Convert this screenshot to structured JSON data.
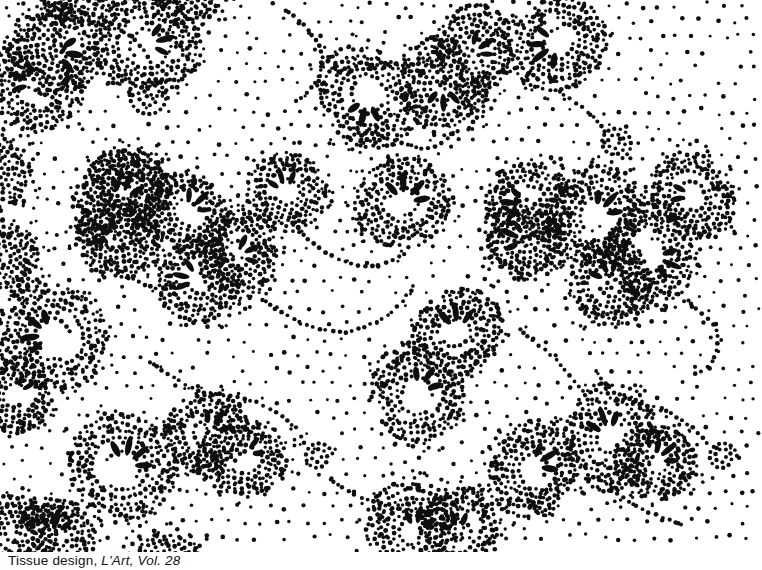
{
  "figure": {
    "caption_roman": "Tissue design, ",
    "caption_italic": "L'Art, Vol. 28",
    "ink_color": "#0e0e0e",
    "background_color": "#ffffff",
    "width": 762,
    "height": 570,
    "pattern_height": 552
  },
  "pattern": {
    "seed": 11,
    "background_dots": {
      "spacing": 16,
      "jitter": 7,
      "radius": 1.9,
      "radius_jitter": 0.5,
      "clear_radius": 27
    },
    "cloud": {
      "dot_radius": 2.05,
      "dot_radius_jitter": 0.45,
      "ring_radii": [
        15,
        21,
        27,
        33,
        39,
        46
      ],
      "cloudlet_ring_radii": [
        8,
        14,
        20,
        26,
        32,
        38
      ],
      "ring_spacing": 6.3,
      "scatter_count": 70,
      "fringe_count": 13
    },
    "petal": {
      "length": 19,
      "width": 6.4,
      "offset": 10,
      "spread_deg": 40
    },
    "clusters": [
      {
        "x": 57,
        "y": 50,
        "petals": 3,
        "rot": 10,
        "size": 1.0
      },
      {
        "x": 35,
        "y": 84,
        "petals": 3,
        "rot": 205,
        "size": 0.95
      },
      {
        "x": 147,
        "y": 45,
        "petals": 3,
        "rot": -15,
        "size": 0.95
      },
      {
        "x": 367,
        "y": 97,
        "petals": 3,
        "rot": 105,
        "size": 1.0
      },
      {
        "x": 444,
        "y": 86,
        "petals": 3,
        "rot": 90,
        "size": 0.95
      },
      {
        "x": 471,
        "y": 52,
        "petals": 3,
        "rot": -35,
        "size": 0.9
      },
      {
        "x": 558,
        "y": 44,
        "petals": 4,
        "rot": 160,
        "size": 1.0
      },
      {
        "x": 120,
        "y": 200,
        "petals": 3,
        "rot": -70,
        "size": 1.0
      },
      {
        "x": 187,
        "y": 213,
        "petals": 3,
        "rot": -45,
        "size": 0.9
      },
      {
        "x": 118,
        "y": 240,
        "petals": 3,
        "rot": 215,
        "size": 0.95
      },
      {
        "x": 238,
        "y": 255,
        "petals": 3,
        "rot": -25,
        "size": 0.9
      },
      {
        "x": 200,
        "y": 280,
        "petals": 3,
        "rot": 195,
        "size": 0.9
      },
      {
        "x": 52,
        "y": 336,
        "petals": 4,
        "rot": -165,
        "size": 1.05
      },
      {
        "x": 287,
        "y": 192,
        "petals": 3,
        "rot": -105,
        "size": 0.9
      },
      {
        "x": 404,
        "y": 202,
        "petals": 4,
        "rot": -70,
        "size": 1.0
      },
      {
        "x": 457,
        "y": 333,
        "petals": 3,
        "rot": -95,
        "size": 1.0
      },
      {
        "x": 528,
        "y": 204,
        "petals": 3,
        "rot": 185,
        "size": 0.9
      },
      {
        "x": 595,
        "y": 214,
        "petals": 3,
        "rot": -45,
        "size": 1.0
      },
      {
        "x": 526,
        "y": 240,
        "petals": 3,
        "rot": 200,
        "size": 0.9
      },
      {
        "x": 651,
        "y": 255,
        "petals": 3,
        "rot": 20,
        "size": 1.0
      },
      {
        "x": 611,
        "y": 282,
        "petals": 3,
        "rot": -115,
        "size": 0.9
      },
      {
        "x": 693,
        "y": 196,
        "petals": 2,
        "rot": -170,
        "size": 0.9
      },
      {
        "x": 15,
        "y": 395,
        "petals": 2,
        "rot": -50,
        "size": 0.85
      },
      {
        "x": 123,
        "y": 467,
        "petals": 4,
        "rot": -60,
        "size": 1.05
      },
      {
        "x": 207,
        "y": 433,
        "petals": 3,
        "rot": -55,
        "size": 0.95
      },
      {
        "x": 242,
        "y": 457,
        "petals": 2,
        "rot": -30,
        "size": 0.9
      },
      {
        "x": 17,
        "y": 532,
        "petals": 2,
        "rot": -50,
        "size": 0.85
      },
      {
        "x": 55,
        "y": 537,
        "petals": 3,
        "rot": -80,
        "size": 0.95
      },
      {
        "x": 417,
        "y": 392,
        "petals": 3,
        "rot": -55,
        "size": 0.95
      },
      {
        "x": 415,
        "y": 532,
        "petals": 3,
        "rot": -75,
        "size": 0.95
      },
      {
        "x": 458,
        "y": 534,
        "petals": 3,
        "rot": -110,
        "size": 0.9
      },
      {
        "x": 533,
        "y": 468,
        "petals": 3,
        "rot": -30,
        "size": 1.0
      },
      {
        "x": 611,
        "y": 437,
        "petals": 3,
        "rot": -110,
        "size": 1.0
      },
      {
        "x": 655,
        "y": 462,
        "petals": 3,
        "rot": -40,
        "size": 0.9
      },
      {
        "x": 130,
        "y": 185,
        "petals": 2,
        "rot": 205,
        "size": 0.8
      },
      {
        "x": 80,
        "y": -18,
        "petals": 0,
        "rot": 0,
        "size": 1.0
      },
      {
        "x": 185,
        "y": -12,
        "petals": 0,
        "rot": 0,
        "size": 0.9
      },
      {
        "x": 5,
        "y": 258,
        "petals": 0,
        "rot": 0,
        "size": 0.9
      },
      {
        "x": -2,
        "y": 172,
        "petals": 0,
        "rot": 0,
        "size": 0.85
      },
      {
        "x": 168,
        "y": 566,
        "petals": 0,
        "rot": 0,
        "size": 0.9
      }
    ],
    "tendrils": [
      {
        "points": [
          [
            62,
            6
          ],
          [
            100,
            18
          ],
          [
            134,
            40
          ],
          [
            152,
            68
          ],
          [
            142,
            96
          ]
        ]
      },
      {
        "points": [
          [
            286,
            10
          ],
          [
            308,
            30
          ],
          [
            322,
            58
          ],
          [
            312,
            88
          ],
          [
            292,
            104
          ]
        ]
      },
      {
        "points": [
          [
            560,
            92
          ],
          [
            588,
            112
          ],
          [
            608,
            134
          ]
        ]
      },
      {
        "points": [
          [
            92,
            252
          ],
          [
            122,
            272
          ],
          [
            156,
            288
          ],
          [
            190,
            283
          ]
        ]
      },
      {
        "points": [
          [
            262,
            300
          ],
          [
            300,
            322
          ],
          [
            346,
            332
          ],
          [
            392,
            312
          ],
          [
            416,
            282
          ]
        ]
      },
      {
        "points": [
          [
            300,
            232
          ],
          [
            332,
            256
          ],
          [
            372,
            266
          ],
          [
            408,
            252
          ]
        ]
      },
      {
        "points": [
          [
            150,
            362
          ],
          [
            198,
            390
          ],
          [
            256,
            402
          ],
          [
            296,
            428
          ],
          [
            306,
            448
          ]
        ]
      },
      {
        "points": [
          [
            520,
            330
          ],
          [
            556,
            360
          ],
          [
            588,
            398
          ]
        ]
      },
      {
        "points": [
          [
            688,
            300
          ],
          [
            716,
            330
          ],
          [
            712,
            362
          ],
          [
            690,
            376
          ]
        ]
      },
      {
        "points": [
          [
            598,
            478
          ],
          [
            636,
            506
          ],
          [
            684,
            526
          ]
        ]
      },
      {
        "points": [
          [
            350,
            118
          ],
          [
            388,
            138
          ],
          [
            428,
            148
          ],
          [
            456,
            132
          ]
        ]
      },
      {
        "points": [
          [
            662,
            408
          ],
          [
            692,
            428
          ],
          [
            710,
            446
          ]
        ]
      },
      {
        "points": [
          [
            330,
            480
          ],
          [
            368,
            500
          ],
          [
            424,
            512
          ],
          [
            466,
            496
          ]
        ]
      }
    ],
    "spirals": [
      {
        "x": 615,
        "y": 143,
        "r0": 4,
        "r1": 17,
        "turns": 2.2
      },
      {
        "x": 318,
        "y": 457,
        "r0": 3.5,
        "r1": 15,
        "turns": 2.0
      },
      {
        "x": 722,
        "y": 457,
        "r0": 4,
        "r1": 15,
        "turns": 2.0
      },
      {
        "x": 150,
        "y": 96,
        "r0": 7,
        "r1": 22,
        "turns": 1.7
      },
      {
        "x": 545,
        "y": 505,
        "r0": 4,
        "r1": 13,
        "turns": 1.8
      }
    ]
  }
}
